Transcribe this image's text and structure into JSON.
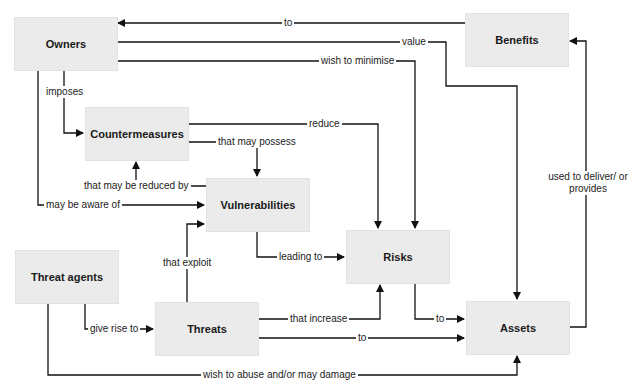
{
  "diagram": {
    "type": "concept-relationship-diagram",
    "nodes": {
      "owners": "Owners",
      "benefits": "Benefits",
      "countermeasures": "Countermeasures",
      "vulnerabilities": "Vulnerabilities",
      "risks": "Risks",
      "threat_agents": "Threat agents",
      "threats": "Threats",
      "assets": "Assets"
    },
    "edges": {
      "benefits_to_owners": "to",
      "owners_value_assets": "value",
      "owners_minimise_risks": "wish to minimise",
      "owners_imposes_countermeasures": "imposes",
      "countermeasures_reduce_risks": "reduce",
      "countermeasures_possess_vulnerabilities": "that may possess",
      "vulnerabilities_reduced_by_countermeasures": "that may be reduced by",
      "owners_aware_vulnerabilities": "may be aware of",
      "assets_deliver_benefits": "used to deliver/ or provides",
      "threats_exploit_vulnerabilities": "that exploit",
      "vulnerabilities_leading_to_risks": "leading to",
      "threatagents_giverise_threats": "give rise to",
      "threats_increase_risks": "that increase",
      "risks_to_assets": "to",
      "threats_to_assets": "to",
      "threatagents_abuse_assets": "wish to abuse and/or may damage"
    },
    "colors": {
      "box_fill": "#ebebeb",
      "line": "#111111",
      "background": "#ffffff"
    }
  }
}
